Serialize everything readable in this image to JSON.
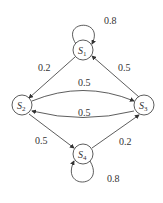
{
  "diagram": {
    "type": "markov-chain",
    "nodes": [
      {
        "id": "S1",
        "label": "S",
        "sub": "1"
      },
      {
        "id": "S2",
        "label": "S",
        "sub": "2"
      },
      {
        "id": "S3",
        "label": "S",
        "sub": "3"
      },
      {
        "id": "S4",
        "label": "S",
        "sub": "4"
      }
    ],
    "edges": [
      {
        "from": "S1",
        "to": "S1",
        "label": "0.8"
      },
      {
        "from": "S1",
        "to": "S2",
        "label": "0.2"
      },
      {
        "from": "S3",
        "to": "S1",
        "label": "0.5"
      },
      {
        "from": "S2",
        "to": "S3",
        "label": "0.5"
      },
      {
        "from": "S3",
        "to": "S2",
        "label": "0.5"
      },
      {
        "from": "S2",
        "to": "S4",
        "label": "0.5"
      },
      {
        "from": "S4",
        "to": "S3",
        "label": "0.2"
      },
      {
        "from": "S4",
        "to": "S4",
        "label": "0.8"
      }
    ]
  }
}
